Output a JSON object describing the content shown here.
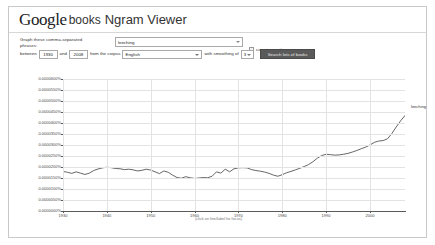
{
  "header": {
    "brand_google": "Google",
    "brand_books": "books",
    "product": "Ngram Viewer"
  },
  "controls": {
    "phrases_label": "Graph these comma-separated phrases:",
    "query_value": "leeching",
    "query_placeholder": "leeching",
    "case_insensitive_label": "case-insensitive",
    "case_insensitive_checked": false,
    "between_label": "between",
    "year_start": "1930",
    "and_label": "and",
    "year_end": "2008",
    "corpus_label": "from the corpus",
    "corpus_value": "English",
    "smoothing_label": "with smoothing of",
    "smoothing_value": "3",
    "submit_label": "Search lots of books"
  },
  "chart_caption": "(click on line/label for focus)",
  "chart_data": {
    "type": "line",
    "title": "",
    "xlabel": "",
    "ylabel": "",
    "xlim": [
      1930,
      2008
    ],
    "ylim": [
      0.0,
      6e-05
    ],
    "grid": true,
    "legend_position": "right-end-label",
    "xticks": [
      1930,
      1940,
      1950,
      1960,
      1970,
      1980,
      1990,
      2000
    ],
    "xticklabels": [
      "1930",
      "1940",
      "1950",
      "1960",
      "1970",
      "1980",
      "1990",
      "2000"
    ],
    "yticks": [
      0.0,
      5e-06,
      1e-05,
      1.5e-05,
      2e-05,
      2.5e-05,
      3e-05,
      3.5e-05,
      4e-05,
      4.5e-05,
      5e-05,
      5.5e-05,
      6e-05
    ],
    "yticklabels": [
      "0.0000000%",
      "0.0000050%",
      "0.0000100%",
      "0.0000150%",
      "0.0000200%",
      "0.0000250%",
      "0.0000300%",
      "0.0000350%",
      "0.0000400%",
      "0.0000450%",
      "0.0000500%",
      "0.0000550%",
      "0.0000600%"
    ],
    "series": [
      {
        "name": "leeching",
        "color": "#555555",
        "x": [
          1930,
          1931,
          1932,
          1933,
          1934,
          1935,
          1936,
          1937,
          1938,
          1939,
          1940,
          1941,
          1942,
          1943,
          1944,
          1945,
          1946,
          1947,
          1948,
          1949,
          1950,
          1951,
          1952,
          1953,
          1954,
          1955,
          1956,
          1957,
          1958,
          1959,
          1960,
          1961,
          1962,
          1963,
          1964,
          1965,
          1966,
          1967,
          1968,
          1969,
          1970,
          1971,
          1972,
          1973,
          1974,
          1975,
          1976,
          1977,
          1978,
          1979,
          1980,
          1981,
          1982,
          1983,
          1984,
          1985,
          1986,
          1987,
          1988,
          1989,
          1990,
          1991,
          1992,
          1993,
          1994,
          1995,
          1996,
          1997,
          1998,
          1999,
          2000,
          2001,
          2002,
          2003,
          2004,
          2005,
          2006,
          2007,
          2008
        ],
        "values": [
          1.8e-05,
          1.76e-05,
          1.71e-05,
          1.78e-05,
          1.72e-05,
          1.66e-05,
          1.72e-05,
          1.84e-05,
          1.91e-05,
          1.96e-05,
          1.99e-05,
          1.97e-05,
          1.93e-05,
          1.92e-05,
          1.88e-05,
          1.9e-05,
          1.87e-05,
          1.82e-05,
          1.85e-05,
          1.9e-05,
          1.86e-05,
          1.78e-05,
          1.7e-05,
          1.82e-05,
          1.76e-05,
          1.63e-05,
          1.52e-05,
          1.49e-05,
          1.56e-05,
          1.51e-05,
          1.48e-05,
          1.5e-05,
          1.52e-05,
          1.51e-05,
          1.58e-05,
          1.78e-05,
          1.72e-05,
          1.9e-05,
          1.78e-05,
          1.92e-05,
          1.96e-05,
          1.97e-05,
          1.96e-05,
          1.88e-05,
          1.84e-05,
          1.81e-05,
          1.77e-05,
          1.71e-05,
          1.63e-05,
          1.58e-05,
          1.65e-05,
          1.74e-05,
          1.8e-05,
          1.87e-05,
          1.94e-05,
          2.02e-05,
          2.11e-05,
          2.24e-05,
          2.4e-05,
          2.52e-05,
          2.58e-05,
          2.56e-05,
          2.54e-05,
          2.55e-05,
          2.58e-05,
          2.62e-05,
          2.68e-05,
          2.75e-05,
          2.83e-05,
          2.9e-05,
          3e-05,
          3.12e-05,
          3.18e-05,
          3.2e-05,
          3.28e-05,
          3.52e-05,
          3.82e-05,
          4.1e-05,
          4.34e-05
        ]
      }
    ]
  }
}
